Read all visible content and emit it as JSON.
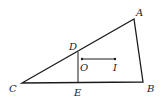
{
  "diagram": {
    "points": {
      "A": {
        "label": "A",
        "x": 134,
        "y": 19
      },
      "B": {
        "label": "B",
        "x": 143,
        "y": 82
      },
      "C": {
        "label": "C",
        "x": 22,
        "y": 83
      },
      "D": {
        "label": "D",
        "x": 78,
        "y": 52
      },
      "E": {
        "label": "E",
        "x": 78,
        "y": 82
      },
      "O": {
        "label": "O",
        "x": 82,
        "y": 59
      },
      "I": {
        "label": "I",
        "x": 115,
        "y": 59
      }
    },
    "segments": [
      "AB",
      "BC",
      "CA",
      "DE",
      "OI"
    ],
    "colors": {
      "stroke": "#1a1a1a",
      "background": "#ffffff"
    }
  }
}
